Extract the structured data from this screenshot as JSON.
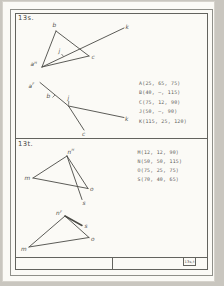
{
  "colors": {
    "outside": "#c9c6bf",
    "paper": "#fbfaf6",
    "frame": "#8f8f89",
    "rule": "#63635e",
    "ink": "#4a4a45"
  },
  "titleblock": {
    "ref": "13s,t"
  },
  "problems": [
    {
      "label": "13s.",
      "coords": [
        "A(25, 65, 75)",
        "B(40, –, 115)",
        "C(75, 12, 90)",
        "J(50, –, 90)",
        "K(115, 25, 120)"
      ]
    },
    {
      "label": "13t.",
      "coords": [
        "M(12, 12, 90)",
        "N(50, 50, 115)",
        "O(75, 25, 75)",
        "S(70, 40, 65)"
      ]
    }
  ],
  "figures": [
    {
      "name": "13s-top-view",
      "edges": [
        [
          42,
          67,
          56,
          31
        ],
        [
          56,
          31,
          89,
          56
        ],
        [
          42,
          67,
          89,
          56
        ],
        [
          42,
          67,
          124,
          28
        ]
      ],
      "ticks": [
        [
          61.5,
          54,
          63.5,
          56.5
        ]
      ],
      "labels": [
        {
          "t": "b",
          "x": 52.5,
          "y": 27
        },
        {
          "t": "a",
          "sup": "H",
          "x": 30.5,
          "y": 66
        },
        {
          "t": "c",
          "x": 91.5,
          "y": 58.5
        },
        {
          "t": "j",
          "x": 58.5,
          "y": 53
        },
        {
          "t": "k",
          "x": 125.5,
          "y": 29
        }
      ]
    },
    {
      "name": "13s-front-view",
      "edges": [
        [
          40,
          82.5,
          68.5,
          106
        ],
        [
          68.5,
          106,
          84,
          130
        ],
        [
          68.5,
          106,
          124,
          117.5
        ]
      ],
      "ticks": [
        [
          52.5,
          97.5,
          55,
          95
        ],
        [
          68.8,
          101,
          68.6,
          104.8
        ]
      ],
      "labels": [
        {
          "t": "a",
          "sup": "F",
          "x": 28.5,
          "y": 87.5
        },
        {
          "t": "b",
          "x": 46.5,
          "y": 98
        },
        {
          "t": "j",
          "x": 67.5,
          "y": 100
        },
        {
          "t": "c",
          "x": 82,
          "y": 135.5
        },
        {
          "t": "k",
          "x": 125,
          "y": 121
        }
      ]
    },
    {
      "name": "13t-top-view",
      "edges": [
        [
          33,
          178,
          67,
          156
        ],
        [
          33,
          178,
          88,
          188.5
        ],
        [
          67,
          156,
          88,
          188.5
        ],
        [
          67,
          156,
          82,
          199.5
        ]
      ],
      "ticks": [],
      "labels": [
        {
          "t": "m",
          "x": 24.5,
          "y": 180
        },
        {
          "t": "n",
          "sup": "H",
          "x": 67.5,
          "y": 153.5
        },
        {
          "t": "o",
          "x": 90,
          "y": 190.5
        },
        {
          "t": "s",
          "x": 82.5,
          "y": 205
        }
      ]
    },
    {
      "name": "13t-front-view",
      "edges": [
        [
          29,
          247,
          65,
          216
        ],
        [
          29,
          247,
          89,
          237.5
        ],
        [
          65,
          216,
          89,
          237.5
        ],
        [
          65,
          216,
          82,
          225.5,
          1.5
        ]
      ],
      "ticks": [],
      "labels": [
        {
          "t": "n",
          "sup": "F",
          "x": 56,
          "y": 215
        },
        {
          "t": "s",
          "x": 84.5,
          "y": 228
        },
        {
          "t": "o",
          "x": 91,
          "y": 240.5
        },
        {
          "t": "m",
          "x": 21,
          "y": 250.5
        }
      ]
    }
  ]
}
